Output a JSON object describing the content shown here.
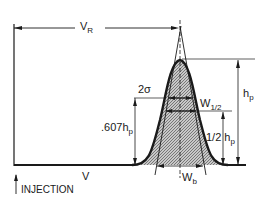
{
  "diagram": {
    "labels": {
      "retention_volume": "V",
      "retention_volume_sub": "R",
      "peak_height": "h",
      "peak_height_sub": "p",
      "sigma_width": "2σ",
      "half_width": "W",
      "half_width_sub": "1/2",
      "frac_height": ".607h",
      "frac_height_sub": "p",
      "half_height": "1/2 h",
      "half_height_sub": "p",
      "base_width": "W",
      "base_width_sub": "b",
      "x_axis": "V",
      "injection": "INJECTION"
    },
    "colors": {
      "ink": "#1a1a1a",
      "fill": "#9a9a9a",
      "background": "#ffffff"
    }
  }
}
